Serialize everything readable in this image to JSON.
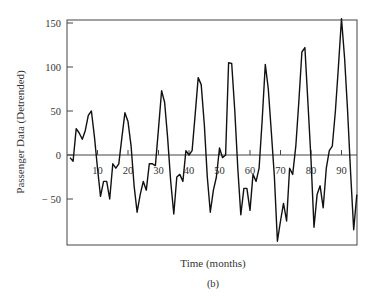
{
  "chart_data": {
    "type": "line",
    "title": "",
    "xlabel": "Time (months)",
    "ylabel": "Passenger Data (Detrended)",
    "caption": "(b)",
    "xlim": [
      0,
      96
    ],
    "ylim": [
      -100,
      155
    ],
    "x_ticks": [
      10,
      20,
      30,
      40,
      50,
      60,
      70,
      80,
      90
    ],
    "y_ticks": [
      150,
      100,
      50,
      0,
      -50
    ],
    "grid": false,
    "legend": null,
    "series": [
      {
        "name": "Passenger Data (Detrended)",
        "x": [
          1,
          2,
          3,
          4,
          5,
          6,
          7,
          8,
          9,
          10,
          11,
          12,
          13,
          14,
          15,
          16,
          17,
          18,
          19,
          20,
          21,
          22,
          23,
          24,
          25,
          26,
          27,
          28,
          29,
          30,
          31,
          32,
          33,
          34,
          35,
          36,
          37,
          38,
          39,
          40,
          41,
          42,
          43,
          44,
          45,
          46,
          47,
          48,
          49,
          50,
          51,
          52,
          53,
          54,
          55,
          56,
          57,
          58,
          59,
          60,
          61,
          62,
          63,
          64,
          65,
          66,
          67,
          68,
          69,
          70,
          71,
          72,
          73,
          74,
          75,
          76,
          77,
          78,
          79,
          80,
          81,
          82,
          83,
          84,
          85,
          86,
          87,
          88,
          89,
          90,
          91,
          92,
          93,
          94,
          95
        ],
        "values": [
          -3,
          -7,
          30,
          25,
          18,
          28,
          45,
          50,
          20,
          -15,
          -47,
          -30,
          -30,
          -50,
          -10,
          -15,
          -10,
          20,
          48,
          38,
          10,
          -35,
          -65,
          -45,
          -30,
          -40,
          -10,
          -10,
          -12,
          30,
          73,
          60,
          20,
          -30,
          -67,
          -25,
          -22,
          -30,
          5,
          0,
          5,
          45,
          88,
          80,
          35,
          -25,
          -65,
          -40,
          -25,
          8,
          -3,
          0,
          105,
          104,
          50,
          -15,
          -68,
          -38,
          -38,
          -63,
          -22,
          -30,
          -15,
          40,
          103,
          75,
          25,
          -25,
          -98,
          -75,
          -55,
          -75,
          -15,
          -22,
          10,
          60,
          117,
          122,
          60,
          -5,
          -82,
          -45,
          -35,
          -60,
          -15,
          5,
          10,
          50,
          100,
          155,
          110,
          50,
          -20,
          -85,
          -45
        ]
      }
    ]
  }
}
